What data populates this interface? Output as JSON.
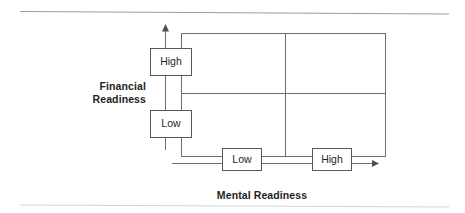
{
  "figure": {
    "width": 465,
    "height": 213,
    "background": "#ffffff",
    "line_color": "#58595b",
    "text_color": "#231f20"
  },
  "axes": {
    "y": {
      "title_line1": "Financial",
      "title_line2": "Readiness",
      "tick_labels": [
        "High",
        "Low"
      ],
      "direction": "up"
    },
    "x": {
      "title": "Mental Readiness",
      "tick_labels": [
        "Low",
        "High"
      ],
      "direction": "right"
    }
  },
  "nodes": [
    {
      "id": "y-high",
      "label": "High",
      "axis": "y"
    },
    {
      "id": "y-low",
      "label": "Low",
      "axis": "y"
    },
    {
      "id": "x-low",
      "label": "Low",
      "axis": "x"
    },
    {
      "id": "x-high",
      "label": "High",
      "axis": "x"
    }
  ],
  "matrix": {
    "rows": 2,
    "cols": 2,
    "row_headers": [
      "High",
      "Low"
    ],
    "col_headers": [
      "Low",
      "High"
    ],
    "cells": [
      {
        "row": "High",
        "col": "Low",
        "text": ""
      },
      {
        "row": "High",
        "col": "High",
        "text": ""
      },
      {
        "row": "Low",
        "col": "Low",
        "text": ""
      },
      {
        "row": "Low",
        "col": "High",
        "text": ""
      }
    ]
  },
  "rules": {
    "top": true,
    "bottom": true
  }
}
